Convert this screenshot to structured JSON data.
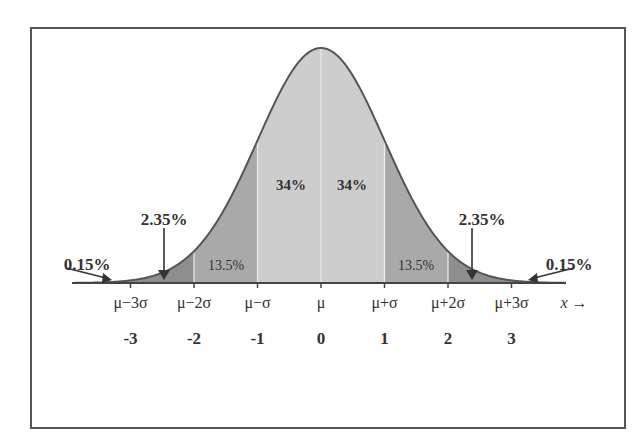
{
  "chart_data": {
    "type": "area",
    "title": "",
    "xlabel": "x →",
    "ylabel": "",
    "x_ticks_sigma": [
      "μ−3σ",
      "μ−2σ",
      "μ−σ",
      "μ",
      "μ+σ",
      "μ+2σ",
      "μ+3σ"
    ],
    "x_ticks_z": [
      "-3",
      "-2",
      "-1",
      "0",
      "1",
      "2",
      "3"
    ],
    "x_axis_arrow_label": "x →",
    "regions": [
      {
        "from": -4,
        "to": -3,
        "label": "0.15%",
        "value": 0.15
      },
      {
        "from": -3,
        "to": -2,
        "label": "2.35%",
        "value": 2.35
      },
      {
        "from": -2,
        "to": -1,
        "label": "13.5%",
        "value": 13.5
      },
      {
        "from": -1,
        "to": 0,
        "label": "34%",
        "value": 34
      },
      {
        "from": 0,
        "to": 1,
        "label": "34%",
        "value": 34
      },
      {
        "from": 1,
        "to": 2,
        "label": "13.5%",
        "value": 13.5
      },
      {
        "from": 2,
        "to": 3,
        "label": "2.35%",
        "value": 2.35
      },
      {
        "from": 3,
        "to": 4,
        "label": "0.15%",
        "value": 0.15
      }
    ],
    "colors": {
      "inner": "#cdcdcd",
      "middle": "#a9a9a9",
      "outer": "#8e8e8e",
      "curve": "#555555",
      "divider": "#ededed"
    },
    "grid": false,
    "legend": "none"
  },
  "labels": {
    "inner_left": "34%",
    "inner_right": "34%",
    "mid_left": "13.5%",
    "mid_right": "13.5%",
    "tail2_left": "2.35%",
    "tail2_right": "2.35%",
    "tail3_left": "0.15%",
    "tail3_right": "0.15%",
    "sigma_ticks": [
      "μ−3σ",
      "μ−2σ",
      "μ−σ",
      "μ",
      "μ+σ",
      "μ+2σ",
      "μ+3σ"
    ],
    "z_ticks": [
      "-3",
      "-2",
      "-1",
      "0",
      "1",
      "2",
      "3"
    ],
    "x_arrow": "x →"
  }
}
